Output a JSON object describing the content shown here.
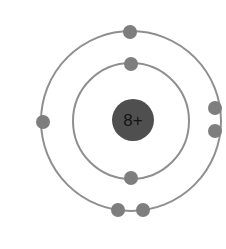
{
  "diagram": {
    "type": "bohr-atomic-model",
    "background_color": "#ffffff",
    "width": 226,
    "height": 249,
    "center": {
      "x": 131,
      "y": 121
    },
    "nucleus": {
      "label": "8+",
      "charge_number": 8,
      "charge_sign": "+",
      "cx": 133,
      "cy": 120,
      "r": 21,
      "fill_color": "#4f4f4f",
      "text_color": "#141414",
      "font_size": 17
    },
    "shells": [
      {
        "name": "inner-shell",
        "index": 1,
        "label": "K",
        "cx": 131,
        "cy": 121,
        "r": 58,
        "stroke_color": "#8f8f8f",
        "stroke_width": 2,
        "electron_count": 2
      },
      {
        "name": "outer-shell",
        "index": 2,
        "label": "L",
        "cx": 131,
        "cy": 121,
        "r": 90,
        "stroke_color": "#8f8f8f",
        "stroke_width": 2,
        "electron_count": 6
      }
    ],
    "electrons": [
      {
        "name": "electron-inner-top",
        "shell": 1,
        "cx": 131,
        "cy": 64,
        "r": 7,
        "fill_color": "#7e7e7e"
      },
      {
        "name": "electron-inner-bottom",
        "shell": 1,
        "cx": 131,
        "cy": 178,
        "r": 7,
        "fill_color": "#7e7e7e"
      },
      {
        "name": "electron-outer-top",
        "shell": 2,
        "cx": 130,
        "cy": 32,
        "r": 7,
        "fill_color": "#7e7e7e"
      },
      {
        "name": "electron-outer-left",
        "shell": 2,
        "cx": 43,
        "cy": 122,
        "r": 7,
        "fill_color": "#7e7e7e"
      },
      {
        "name": "electron-outer-right-upper",
        "shell": 2,
        "cx": 215,
        "cy": 108,
        "r": 7,
        "fill_color": "#7e7e7e"
      },
      {
        "name": "electron-outer-right-lower",
        "shell": 2,
        "cx": 215,
        "cy": 131,
        "r": 7,
        "fill_color": "#7e7e7e"
      },
      {
        "name": "electron-outer-bottom-left",
        "shell": 2,
        "cx": 118,
        "cy": 210,
        "r": 7,
        "fill_color": "#7e7e7e"
      },
      {
        "name": "electron-outer-bottom-right",
        "shell": 2,
        "cx": 143,
        "cy": 210,
        "r": 7,
        "fill_color": "#7e7e7e"
      }
    ]
  }
}
